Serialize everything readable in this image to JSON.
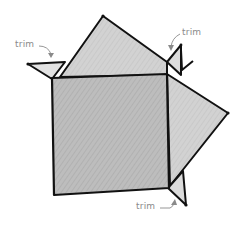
{
  "diagram": {
    "colors": {
      "outline": "#111111",
      "square_fill": "#b9b9b9",
      "flap_fill": "#cfcfcf",
      "small_flap_fill": "#dcdcdc",
      "label": "#8a8a8a"
    },
    "labels": [
      {
        "id": "trim-left",
        "text": "trim"
      },
      {
        "id": "trim-top-right",
        "text": "trim"
      },
      {
        "id": "trim-bottom-right",
        "text": "trim"
      }
    ]
  }
}
